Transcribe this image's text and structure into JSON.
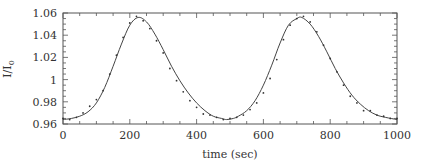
{
  "chart_data": {
    "type": "line",
    "title": "",
    "xlabel": "time (sec)",
    "ylabel": "I/I",
    "ylabel_subscript": "0",
    "xlim": [
      0,
      1000
    ],
    "ylim": [
      0.96,
      1.06
    ],
    "xticks": [
      0,
      200,
      400,
      600,
      800,
      1000
    ],
    "xtick_labels": [
      "0",
      "200",
      "400",
      "600",
      "800",
      "1000"
    ],
    "yticks": [
      0.96,
      0.98,
      1.0,
      1.02,
      1.04,
      1.06
    ],
    "ytick_labels": [
      "0.96",
      "0.98",
      "1",
      "1.02",
      "1.04",
      "1.06"
    ],
    "grid": false,
    "legend": null,
    "series": [
      {
        "name": "fit",
        "style": "solid",
        "x": [
          0,
          25,
          50,
          75,
          100,
          125,
          150,
          175,
          200,
          225,
          250,
          275,
          300,
          325,
          350,
          375,
          400,
          425,
          450,
          475,
          490,
          510,
          525,
          550,
          575,
          600,
          625,
          650,
          675,
          700,
          715,
          740,
          765,
          790,
          815,
          840,
          865,
          890,
          915,
          940,
          965,
          1000
        ],
        "values": [
          0.964,
          0.965,
          0.967,
          0.971,
          0.979,
          0.993,
          1.012,
          1.032,
          1.049,
          1.056,
          1.052,
          1.041,
          1.027,
          1.012,
          0.999,
          0.988,
          0.979,
          0.972,
          0.967,
          0.965,
          0.964,
          0.965,
          0.967,
          0.972,
          0.981,
          0.995,
          1.013,
          1.033,
          1.049,
          1.055,
          1.056,
          1.05,
          1.039,
          1.025,
          1.01,
          0.997,
          0.986,
          0.978,
          0.972,
          0.968,
          0.966,
          0.964
        ]
      },
      {
        "name": "data",
        "style": "markers",
        "x": [
          0,
          20,
          40,
          60,
          80,
          100,
          120,
          140,
          160,
          180,
          200,
          220,
          240,
          260,
          280,
          300,
          320,
          340,
          360,
          380,
          400,
          420,
          440,
          460,
          480,
          500,
          520,
          540,
          560,
          580,
          600,
          620,
          640,
          660,
          680,
          700,
          720,
          740,
          760,
          780,
          800,
          820,
          840,
          860,
          880,
          900,
          920,
          940,
          960,
          980,
          1000
        ],
        "values": [
          0.965,
          0.964,
          0.966,
          0.97,
          0.976,
          0.982,
          0.99,
          1.005,
          1.022,
          1.038,
          1.051,
          1.057,
          1.053,
          1.046,
          1.035,
          1.024,
          1.01,
          0.999,
          0.989,
          0.981,
          0.975,
          0.969,
          0.968,
          0.966,
          0.964,
          0.965,
          0.966,
          0.968,
          0.973,
          0.979,
          0.988,
          1.001,
          1.018,
          1.036,
          1.049,
          1.055,
          1.057,
          1.052,
          1.043,
          1.031,
          1.019,
          1.007,
          0.995,
          0.985,
          0.979,
          0.972,
          0.972,
          0.968,
          0.967,
          0.965,
          0.965
        ]
      }
    ]
  }
}
